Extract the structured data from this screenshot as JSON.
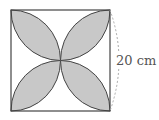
{
  "figure": {
    "shape": "square with four leaf (lens) shapes formed by quarter-circle arcs",
    "dimension_label": "20 cm",
    "colors": {
      "fill": "#c8c8c8",
      "stroke": "#444444",
      "dashed": "#aaaaaa",
      "label": "#555555"
    }
  }
}
